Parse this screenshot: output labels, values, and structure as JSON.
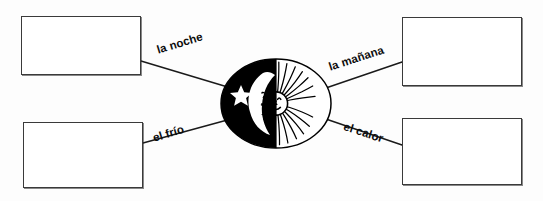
{
  "worksheet": {
    "title": "Day and night vocabulary matching diagram",
    "background_color": "#fdfdfd",
    "line_color": "#1a1a1a",
    "box_border_color": "#3a3a3a"
  },
  "center": {
    "emblem_name": "sun-moon-oval",
    "night_half": {
      "label": "night-half",
      "fill": "#000000",
      "moon_icon": "crescent-moon-face-icon",
      "star_icon": "five-pointed-star-icon"
    },
    "day_half": {
      "label": "day-half",
      "fill": "#ffffff",
      "sun_icon": "radiant-sun-face-icon"
    }
  },
  "labels": [
    {
      "id": "la-noche",
      "text": "la noche",
      "position": "top-left"
    },
    {
      "id": "la-manana",
      "text": "la mañana",
      "position": "top-right"
    },
    {
      "id": "el-frio",
      "text": "el frío",
      "position": "bottom-left"
    },
    {
      "id": "el-calor",
      "text": "el calor",
      "position": "bottom-right"
    }
  ],
  "answer_boxes": [
    {
      "id": "top-left",
      "value": "",
      "placeholder": ""
    },
    {
      "id": "top-right",
      "value": "",
      "placeholder": ""
    },
    {
      "id": "bottom-left",
      "value": "",
      "placeholder": ""
    },
    {
      "id": "bottom-right",
      "value": "",
      "placeholder": ""
    }
  ]
}
